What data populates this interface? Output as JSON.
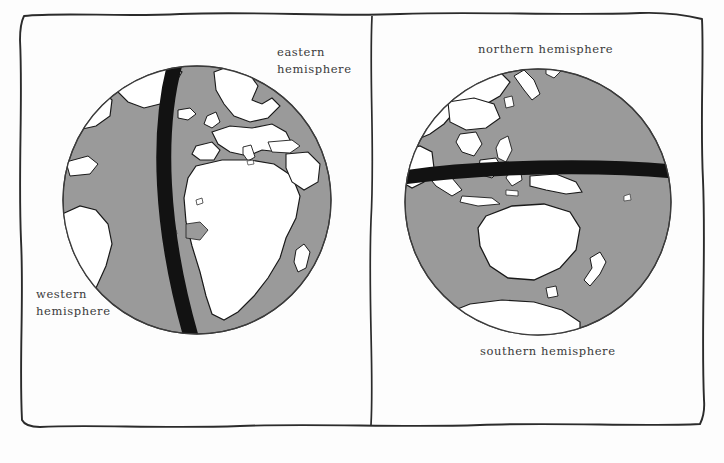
{
  "figure": {
    "type": "diagram",
    "panel_count": 2,
    "background_color": "#fdfdfd",
    "frame": {
      "style": "hand-drawn-rectangle",
      "stroke_color": "#2b2b2b",
      "divider": "vertical-hand-drawn-line"
    }
  },
  "globe_style": {
    "ocean_color": "#9a9a9a",
    "land_color": "#ffffff",
    "outline_color": "#1a1a1a",
    "band_color": "#121212",
    "sphere_edge_color": "#3a3a3a"
  },
  "panels": [
    {
      "id": "left-panel",
      "name": "eastern-western-hemispheres",
      "globe": {
        "name": "globe-prime-meridian",
        "center_x": 197,
        "center_y": 200,
        "radius": 135,
        "band": {
          "name": "prime-meridian-band",
          "orientation": "vertical",
          "color": "#121212"
        },
        "visible_regions": [
          "Europe",
          "Africa",
          "Greenland",
          "South America",
          "North Atlantic",
          "Arabia",
          "Mediterranean"
        ]
      },
      "labels": [
        {
          "id": "label-eastern",
          "name": "eastern-hemisphere-label",
          "text": "eastern\nhemisphere",
          "x": 277,
          "y": 44
        },
        {
          "id": "label-western",
          "name": "western-hemisphere-label",
          "text": "western\nhemisphere",
          "x": 36,
          "y": 286
        }
      ]
    },
    {
      "id": "right-panel",
      "name": "northern-southern-hemispheres",
      "globe": {
        "name": "globe-equator",
        "center_x": 538,
        "center_y": 202,
        "radius": 134,
        "band": {
          "name": "equator-band",
          "orientation": "horizontal",
          "color": "#121212"
        },
        "visible_regions": [
          "Asia",
          "Japan",
          "Indonesia",
          "Australia",
          "New Zealand",
          "Antarctica",
          "Philippines",
          "New Guinea"
        ]
      },
      "labels": [
        {
          "id": "label-northern",
          "name": "northern-hemisphere-label",
          "text": "northern hemisphere",
          "x": 478,
          "y": 41
        },
        {
          "id": "label-southern",
          "name": "southern-hemisphere-label",
          "text": "southern hemisphere",
          "x": 480,
          "y": 343
        }
      ]
    }
  ]
}
